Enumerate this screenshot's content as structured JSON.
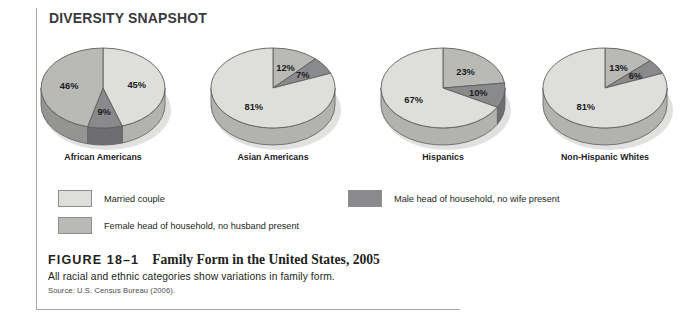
{
  "banner": {
    "title": "DIVERSITY SNAPSHOT"
  },
  "chart_data": {
    "type": "pie",
    "title": "Family Form in the United States, 2005",
    "legend_position": "bottom",
    "grid": false,
    "series": [
      {
        "name": "Married couple",
        "color": "#dedfdb"
      },
      {
        "name": "Male head of household, no wife present",
        "color": "#8a8a8c"
      },
      {
        "name": "Female head of household, no husband present",
        "color": "#b9bab6"
      }
    ],
    "charts": [
      {
        "category": "African Americans",
        "slices": [
          {
            "label": "45%",
            "value": 45,
            "series": "Married couple"
          },
          {
            "label": "9%",
            "value": 9,
            "series": "Male head of household, no wife present"
          },
          {
            "label": "46%",
            "value": 46,
            "series": "Female head of household, no husband present"
          }
        ]
      },
      {
        "category": "Asian Americans",
        "slices": [
          {
            "label": "12%",
            "value": 12,
            "series": "Female head of household, no husband present"
          },
          {
            "label": "7%",
            "value": 7,
            "series": "Male head of household, no wife present"
          },
          {
            "label": "81%",
            "value": 81,
            "series": "Married couple"
          }
        ]
      },
      {
        "category": "Hispanics",
        "slices": [
          {
            "label": "23%",
            "value": 23,
            "series": "Female head of household, no husband present"
          },
          {
            "label": "10%",
            "value": 10,
            "series": "Male head of household, no wife present"
          },
          {
            "label": "67%",
            "value": 67,
            "series": "Married couple"
          }
        ]
      },
      {
        "category": "Non-Hispanic Whites",
        "slices": [
          {
            "label": "13%",
            "value": 13,
            "series": "Female head of household, no husband present"
          },
          {
            "label": "6%",
            "value": 6,
            "series": "Male head of household, no wife present"
          },
          {
            "label": "81%",
            "value": 81,
            "series": "Married couple"
          }
        ]
      }
    ]
  },
  "legend": {
    "items": [
      {
        "label": "Married couple",
        "color": "#dedfdb"
      },
      {
        "label": "Male head of household, no wife present",
        "color": "#8a8a8c"
      },
      {
        "label": "Female head of household, no husband present",
        "color": "#b9bab6"
      }
    ]
  },
  "caption": {
    "figure_number": "FIGURE 18–1",
    "figure_title": "Family Form in the United States, 2005",
    "subtitle": "All racial and ethnic categories show variations in family form.",
    "source": "Source: U.S. Census Bureau (2006)."
  },
  "colors": {
    "rule": "#a9a9ab",
    "married": "#dedfdb",
    "male_head": "#8a8a8c",
    "female_head": "#b9bab6",
    "stroke": "#5d5d5f",
    "text": "#231f20"
  }
}
